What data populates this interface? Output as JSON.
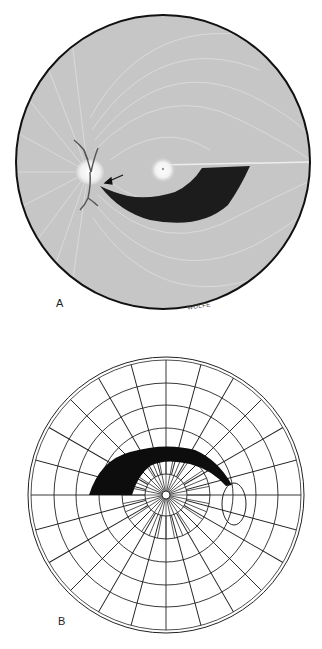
{
  "figure": {
    "panels": [
      {
        "id": "A",
        "label": "A",
        "kind": "fundus-drawing",
        "description": "Retina with nerve fiber layer, optic disc, fovea and arcuate nerve fiber bundle defect",
        "signature": "WOLFE",
        "elements": [
          "optic-disc",
          "fovea",
          "retinal-vessels",
          "arrow",
          "arcuate-defect"
        ]
      },
      {
        "id": "B",
        "label": "B",
        "kind": "visual-field-chart",
        "description": "Polar grid visual field with arcuate scotoma and blind spot",
        "elements": [
          "polar-grid",
          "arcuate-scotoma",
          "blind-spot"
        ]
      }
    ]
  },
  "colors": {
    "background": "#ffffff",
    "fundus": "#c9c9c9",
    "defect": "#1a1a1a",
    "grid": "#222222"
  }
}
